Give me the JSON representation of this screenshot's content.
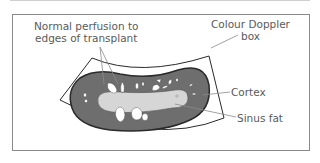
{
  "figure": {
    "labels": {
      "perfusion_line1": "Normal perfusion to",
      "perfusion_line2": "edges of transplant",
      "doppler_line1": "Colour Doppler",
      "doppler_line2": "box",
      "cortex": "Cortex",
      "sinus_fat": "Sinus fat"
    },
    "colors": {
      "cortex_fill": "#6e6e6e",
      "sinus_fill": "#d6d6d6",
      "outline": "#2a2a2a",
      "label_text": "#5a5a5a",
      "leader_line": "#8a8a8a",
      "frame": "#8a8a8a"
    }
  }
}
